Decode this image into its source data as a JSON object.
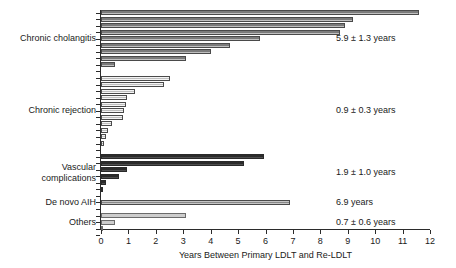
{
  "chart_data": {
    "type": "bar",
    "orientation": "horizontal",
    "title": "",
    "subtitle": "",
    "xlabel": "Years Between Primary LDLT and Re-LDLT",
    "ylabel": "",
    "xlim": [
      0,
      12
    ],
    "xticks": [
      0,
      1,
      2,
      3,
      4,
      5,
      6,
      7,
      8,
      9,
      10,
      11,
      12
    ],
    "xtick_labels": [
      "0",
      "1",
      "2",
      "3",
      "4",
      "5",
      "6",
      "7",
      "8",
      "9",
      "10",
      "11",
      "12"
    ],
    "grid": false,
    "legend": "none",
    "groups": [
      {
        "label": "Chronic cholangitis",
        "label_lines": [
          "Chronic cholangitis"
        ],
        "fill_style": "dark-hatch",
        "color": "#8c8c8c",
        "annotation": "5.9 ± 1.3 years",
        "mean": 5.9,
        "sd": 1.3,
        "n": 9,
        "values": [
          11.6,
          9.2,
          8.9,
          8.7,
          5.8,
          4.7,
          4.0,
          3.1,
          0.5
        ]
      },
      {
        "label": "Chronic rejection",
        "label_lines": [
          "Chronic rejection"
        ],
        "fill_style": "light-hatch",
        "color": "#d4d4d4",
        "annotation": "0.9 ± 0.3 years",
        "mean": 0.9,
        "sd": 0.3,
        "n": 11,
        "values": [
          2.5,
          2.3,
          1.25,
          0.95,
          0.9,
          0.85,
          0.8,
          0.4,
          0.25,
          0.2,
          0.1
        ]
      },
      {
        "label": "Vascular complications",
        "label_lines": [
          "Vascular",
          "complications"
        ],
        "fill_style": "dark-solid",
        "color": "#3a3a3a",
        "annotation": "1.9 ± 1.0 years",
        "mean": 1.9,
        "sd": 1.0,
        "n": 6,
        "values": [
          5.95,
          5.2,
          0.95,
          0.65,
          0.2,
          0.06
        ]
      },
      {
        "label": "De novo AIH",
        "label_lines": [
          "De novo AIH"
        ],
        "fill_style": "medium-hatch",
        "color": "#9e9e9e",
        "annotation": "6.9 years",
        "mean": 6.9,
        "sd": null,
        "n": 1,
        "values": [
          6.9
        ]
      },
      {
        "label": "Others",
        "label_lines": [
          "Others"
        ],
        "fill_style": "light-solid",
        "color": "#cdcdcd",
        "annotation": "0.7 ± 0.6 years",
        "mean": 0.7,
        "sd": 0.6,
        "n": 3,
        "values": [
          3.1,
          0.5,
          0.08
        ]
      }
    ]
  },
  "colors": {
    "axis": "#2b2b2b",
    "text": "#1a1a1a",
    "background": "#ffffff",
    "cholangitis": "#8c8c8c",
    "rejection": "#d4d4d4",
    "vascular": "#3a3a3a",
    "aih": "#9e9e9e",
    "others": "#cdcdcd"
  }
}
